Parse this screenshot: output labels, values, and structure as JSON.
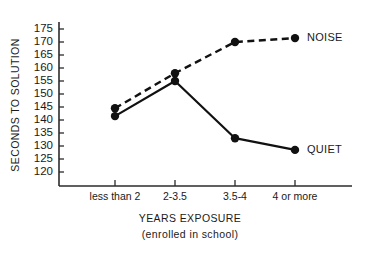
{
  "chart_data": {
    "type": "line",
    "title": "",
    "xlabel": "YEARS EXPOSURE",
    "xlabel_sub": "(enrolled in school)",
    "ylabel": "SECONDS TO SOLUTION",
    "categories": [
      "less than 2",
      "2-3.5",
      "3.5-4",
      "4 or more"
    ],
    "ylim": [
      120,
      175
    ],
    "yticks": [
      120,
      125,
      130,
      135,
      140,
      145,
      150,
      155,
      160,
      165,
      170,
      175
    ],
    "ytick_labels": [
      "120",
      "125",
      "130",
      "135",
      "140",
      "145",
      "150",
      "155",
      "160",
      "165",
      "170",
      "175"
    ],
    "grid": false,
    "legend_position": "right-inline",
    "series": [
      {
        "name": "NOISE",
        "label": "NOISE",
        "style": "dashed",
        "color": "#111111",
        "values": [
          144.5,
          158,
          170,
          171.5
        ]
      },
      {
        "name": "QUIET",
        "label": "QUIET",
        "style": "solid",
        "color": "#111111",
        "values": [
          141.5,
          155,
          133,
          128.5
        ]
      }
    ]
  },
  "axes": {
    "y_axis_name": "SECONDS TO SOLUTION",
    "x_axis_name": "YEARS EXPOSURE",
    "x_axis_subtitle": "(enrolled in school)"
  }
}
